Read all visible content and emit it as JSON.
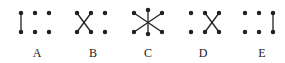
{
  "figures": [
    {
      "label": "A",
      "description": "vertical line on left, four dots"
    },
    {
      "label": "B",
      "description": "X cross on left, two dots on right"
    },
    {
      "label": "C",
      "description": "six-pointed star of lines from center"
    },
    {
      "label": "D",
      "description": "two dots on left, X cross on right"
    },
    {
      "label": "E",
      "description": "four dots, vertical line on right"
    }
  ],
  "colors": {
    "stroke": "#222222",
    "background": "#ffffff"
  }
}
